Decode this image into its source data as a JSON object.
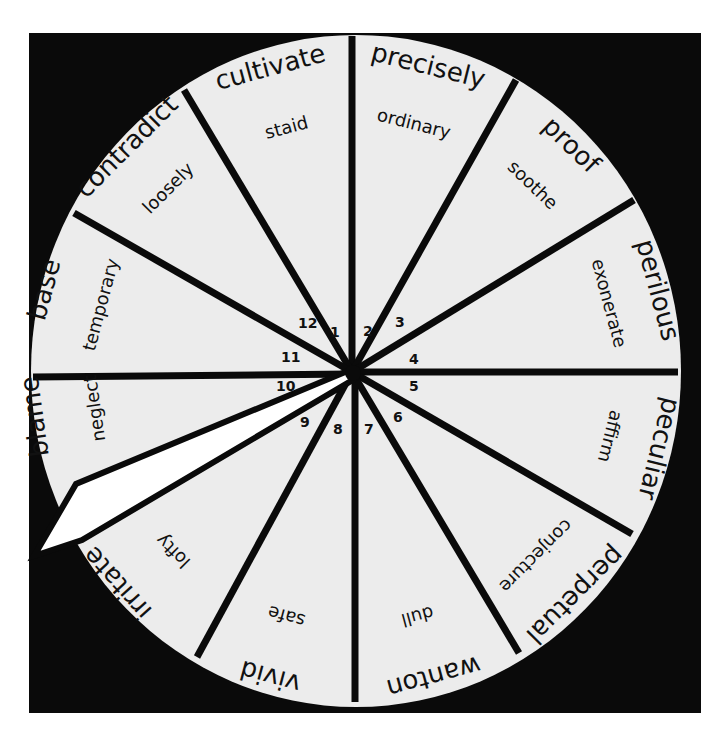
{
  "wheel": {
    "background_color": "#0a0a0a",
    "face_color": "#ececec",
    "pointer_color": "#ffffff",
    "line_color": "#0a0a0a",
    "segments": [
      {
        "number": "1",
        "outer": "cultivate",
        "inner": "staid"
      },
      {
        "number": "2",
        "outer": "precisely",
        "inner": "ordinary"
      },
      {
        "number": "3",
        "outer": "proof",
        "inner": "soothe"
      },
      {
        "number": "4",
        "outer": "perilous",
        "inner": "exonerate"
      },
      {
        "number": "5",
        "outer": "peculiar",
        "inner": "affirm"
      },
      {
        "number": "6",
        "outer": "perpetual",
        "inner": "conjecture"
      },
      {
        "number": "7",
        "outer": "wanton",
        "inner": "dull"
      },
      {
        "number": "8",
        "outer": "vivid",
        "inner": "safe"
      },
      {
        "number": "9",
        "outer": "irritate",
        "inner": "lofty"
      },
      {
        "number": "10",
        "outer": "blame",
        "inner": "neglect"
      },
      {
        "number": "11",
        "outer": "base",
        "inner": "temporary"
      },
      {
        "number": "12",
        "outer": "contradict",
        "inner": "loosely"
      }
    ],
    "pointer": {
      "points_to_segment": "10/9 boundary",
      "icon": "pointer-needle"
    }
  }
}
